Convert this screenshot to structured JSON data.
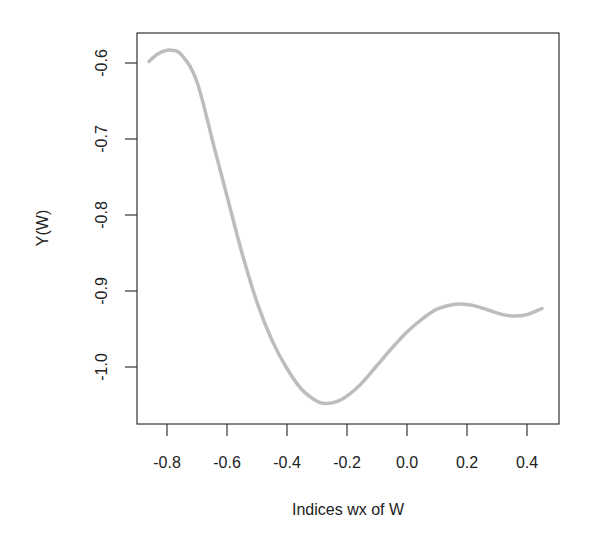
{
  "chart_data": {
    "type": "line",
    "title": "",
    "xlabel": "Indices wx of W",
    "ylabel": "Y(W)",
    "xlim": [
      -0.9,
      0.5
    ],
    "ylim": [
      -1.07,
      -0.56
    ],
    "x_ticks": [
      -0.8,
      -0.6,
      -0.4,
      -0.2,
      0.0,
      0.2,
      0.4
    ],
    "x_tick_labels": [
      "-0.8",
      "-0.6",
      "-0.4",
      "-0.2",
      "0.0",
      "0.2",
      "0.4"
    ],
    "y_ticks": [
      -0.6,
      -0.7,
      -0.8,
      -0.9,
      -1.0
    ],
    "y_tick_labels": [
      "-0.6",
      "-0.7",
      "-0.8",
      "-0.9",
      "-1.0"
    ],
    "grid": false,
    "legend": null,
    "series": [
      {
        "name": "Y(W)",
        "color": "#bdbdbd",
        "x": [
          -0.86,
          -0.83,
          -0.79,
          -0.75,
          -0.7,
          -0.64,
          -0.6,
          -0.55,
          -0.5,
          -0.45,
          -0.4,
          -0.35,
          -0.3,
          -0.27,
          -0.22,
          -0.16,
          -0.1,
          -0.05,
          0.0,
          0.05,
          0.1,
          0.15,
          0.18,
          0.22,
          0.27,
          0.32,
          0.36,
          0.4,
          0.45
        ],
        "y": [
          -0.598,
          -0.588,
          -0.583,
          -0.59,
          -0.625,
          -0.715,
          -0.775,
          -0.85,
          -0.915,
          -0.965,
          -1.002,
          -1.03,
          -1.045,
          -1.048,
          -1.043,
          -1.025,
          -0.998,
          -0.975,
          -0.954,
          -0.937,
          -0.924,
          -0.918,
          -0.917,
          -0.919,
          -0.925,
          -0.931,
          -0.933,
          -0.931,
          -0.923
        ]
      }
    ]
  }
}
